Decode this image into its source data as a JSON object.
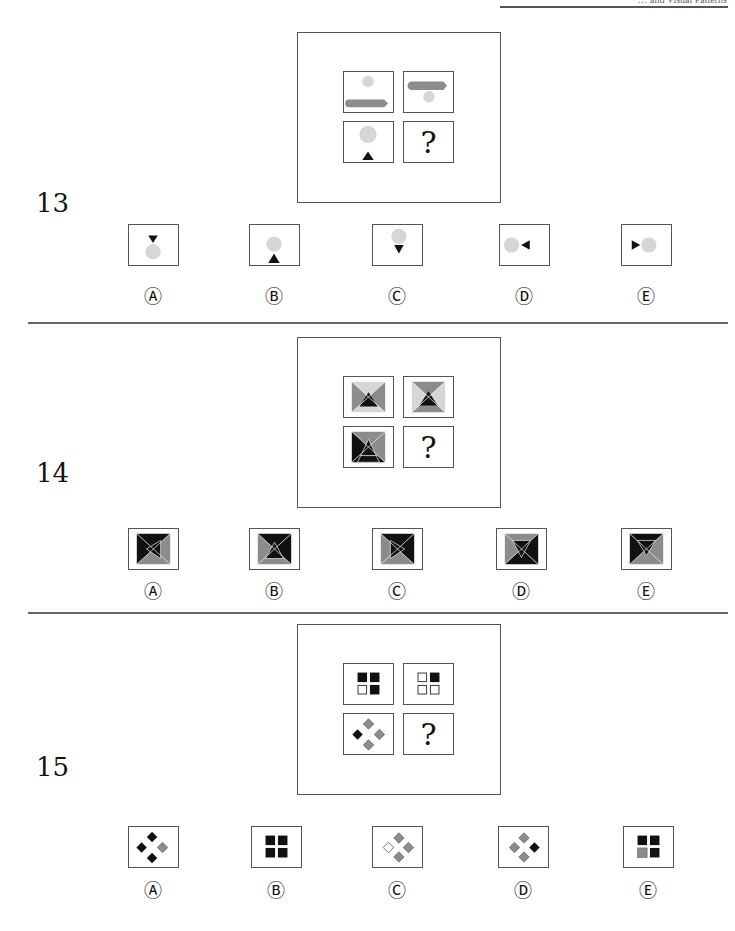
{
  "header": {
    "text": "… and Visual Patterns"
  },
  "questions": [
    {
      "number": "13",
      "question_mark": "?",
      "grid": [
        {
          "desc": "light-gray circle top, dark-gray arrow-bar bottom"
        },
        {
          "desc": "dark-gray arrow-bar top, light-gray circle bottom"
        },
        {
          "desc": "light-gray circle top, black triangle bottom"
        },
        {
          "desc": "question mark"
        }
      ],
      "options": [
        {
          "label": "Ⓐ",
          "desc": "down triangle above circle"
        },
        {
          "label": "Ⓑ",
          "desc": "circle above up triangle"
        },
        {
          "label": "Ⓒ",
          "desc": "circle above down triangle"
        },
        {
          "label": "Ⓓ",
          "desc": "circle left, left-pointing triangle right"
        },
        {
          "label": "Ⓔ",
          "desc": "right-pointing triangle left, circle right"
        }
      ]
    },
    {
      "number": "14",
      "question_mark": "?",
      "grid": [
        {
          "desc": "quadrant pyramid: top/bottom light, left/right gray, black triangle"
        },
        {
          "desc": "quadrant pyramid: top/bottom gray, left/right light, black triangle"
        },
        {
          "desc": "quadrant pyramid: top gray, left black, right gray, bottom black, black triangle with bar"
        },
        {
          "desc": "question mark"
        }
      ],
      "options": [
        {
          "label": "Ⓐ",
          "desc": "left-pointing triangle pyramid"
        },
        {
          "label": "Ⓑ",
          "desc": "up triangle pyramid"
        },
        {
          "label": "Ⓒ",
          "desc": "right-pointing triangle pyramid"
        },
        {
          "label": "Ⓓ",
          "desc": "down triangle pyramid, bottom black"
        },
        {
          "label": "Ⓔ",
          "desc": "down triangle pyramid, top black"
        }
      ]
    },
    {
      "number": "15",
      "question_mark": "?",
      "grid": [
        {
          "desc": "squares: black black / white black"
        },
        {
          "desc": "squares: white black / white white"
        },
        {
          "desc": "diamonds: gray top, black left, gray right, gray bottom"
        },
        {
          "desc": "question mark"
        }
      ],
      "options": [
        {
          "label": "Ⓐ",
          "desc": "diamonds: black top, black left, gray right, black bottom"
        },
        {
          "label": "Ⓑ",
          "desc": "squares: all black"
        },
        {
          "label": "Ⓒ",
          "desc": "diamonds: gray top, white left, gray right, gray bottom"
        },
        {
          "label": "Ⓓ",
          "desc": "diamonds: gray top, gray left, black right, gray bottom"
        },
        {
          "label": "Ⓔ",
          "desc": "squares: black black / gray black"
        }
      ]
    }
  ],
  "colors": {
    "border": "#555555",
    "black": "#111111",
    "dark_gray": "#8c8c8c",
    "mid_gray": "#a0a0a0",
    "light_gray": "#d6d6d6",
    "white": "#ffffff"
  }
}
